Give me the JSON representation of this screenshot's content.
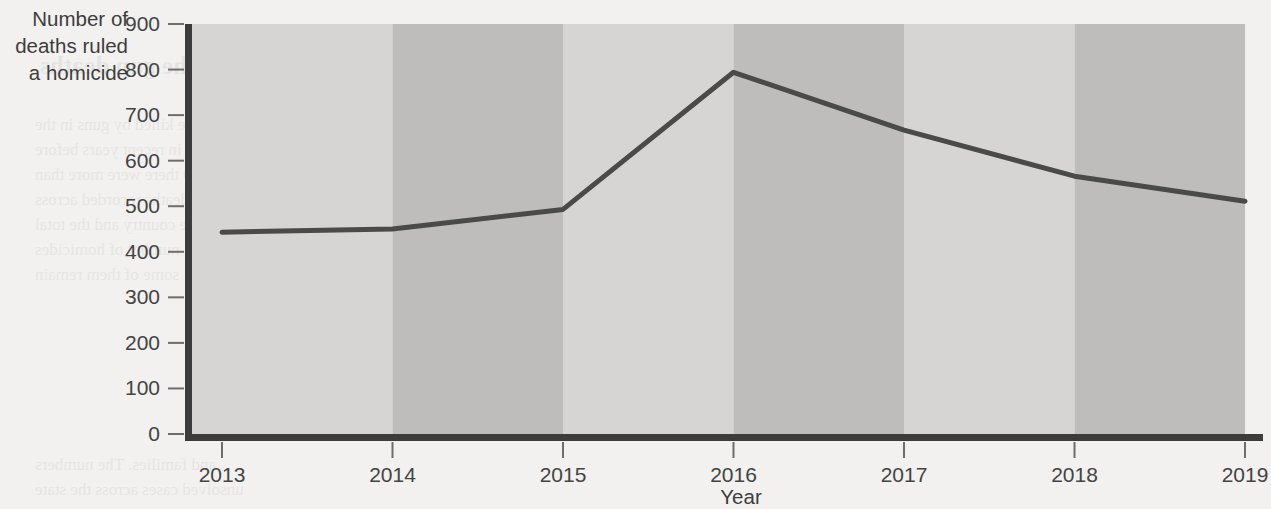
{
  "chart_data": {
    "type": "line",
    "title": "",
    "xlabel": "Year",
    "ylabel": "Number of deaths ruled a homicide",
    "ylabel_lines": [
      "Number of",
      "deaths ruled",
      "a homicide"
    ],
    "categories": [
      "2013",
      "2014",
      "2015",
      "2016",
      "2017",
      "2018",
      "2019"
    ],
    "x": [
      2013,
      2014,
      2015,
      2016,
      2017,
      2018,
      2019
    ],
    "values": [
      443,
      450,
      493,
      794,
      667,
      566,
      511
    ],
    "series": [
      {
        "name": "Number of deaths ruled a homicide",
        "values": [
          443,
          450,
          493,
          794,
          667,
          566,
          511
        ]
      }
    ],
    "ylim": [
      0,
      900
    ],
    "xlim": [
      2013,
      2019
    ],
    "y_ticks": [
      0,
      100,
      200,
      300,
      400,
      500,
      600,
      700,
      800,
      900
    ],
    "y_tick_labels": [
      "0",
      "100",
      "200",
      "300",
      "400",
      "500",
      "600",
      "700",
      "800",
      "900"
    ],
    "x_ticks": [
      2013,
      2014,
      2015,
      2016,
      2017,
      2018,
      2019
    ],
    "x_tick_labels": [
      "2013",
      "2014",
      "2015",
      "2016",
      "2017",
      "2018",
      "2019"
    ],
    "grid": false,
    "legend": "none",
    "banding": "alternating vertical bands between year ticks",
    "colors": {
      "line": "#4a4a4a",
      "axis": "#3c3c3c",
      "band_light": "#d6d5d3",
      "band_dark": "#bebdbb",
      "page_background": "#f2f1ef",
      "tick_label": "#434343"
    }
  },
  "ghost": {
    "lines": [
      "a homicide and the gun deaths",
      "the number of people killed by guns in the",
      "rose sharply in recent years before",
      "In 2019 there were more than",
      "firearm deaths recorded across",
      "the country and the total",
      "number of homicides",
      "some of them remain",
      "and families. The numbers",
      "unsolved cases across the state"
    ]
  }
}
